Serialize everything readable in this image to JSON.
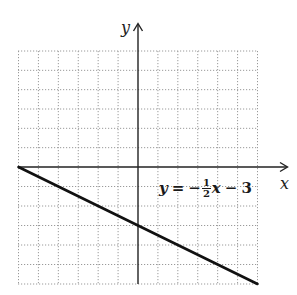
{
  "chart_data": {
    "type": "line",
    "title": "",
    "xlabel": "x",
    "ylabel": "y",
    "xlim": [
      -6,
      6
    ],
    "ylim": [
      -6,
      6
    ],
    "grid": true,
    "grid_style": "dotted",
    "grid_step": 1,
    "series": [
      {
        "name": "y = -1/2 x - 3",
        "equation": "y = -½ x - 3",
        "slope": -0.5,
        "intercept": -3,
        "x": [
          -6,
          -4,
          -2,
          0,
          2,
          4,
          6
        ],
        "y": [
          0,
          -1,
          -2,
          -3,
          -4,
          -5,
          -6
        ]
      }
    ],
    "annotations": [
      {
        "text": "y = -½ x - 3",
        "x": 0.6,
        "y": -2.2
      }
    ]
  },
  "labels": {
    "x_axis": "x",
    "y_axis": "y",
    "equation": {
      "lhs": "y",
      "equals": "=",
      "minus": "−",
      "frac_num": "1",
      "frac_den": "2",
      "var": "x",
      "op": "−",
      "const": "3"
    }
  },
  "colors": {
    "line": "#111111",
    "axis": "#222222",
    "grid": "#9a9a9a",
    "background": "#ffffff"
  }
}
